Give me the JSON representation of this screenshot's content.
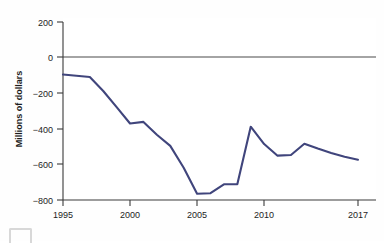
{
  "chart_data": {
    "type": "line",
    "title": "",
    "subtitle": "",
    "xlabel": "",
    "ylabel": "Millions of dollars",
    "xlim": [
      1995,
      2017.5
    ],
    "ylim": [
      -800,
      200
    ],
    "grid": false,
    "legend_position": "none",
    "y_ticks": [
      200,
      0,
      -200,
      -400,
      -600,
      -800
    ],
    "y_tick_labels": [
      "200",
      "0",
      "−200",
      "−400",
      "−600",
      "−800"
    ],
    "x_ticks": [
      1995,
      2000,
      2005,
      2010,
      2017
    ],
    "x_tick_labels": [
      "1995",
      "2000",
      "2005",
      "2010",
      "2017"
    ],
    "zero_reference_line": 0,
    "series": [
      {
        "name": "Net balance",
        "color": "#40457c",
        "x": [
          1995,
          1996,
          1997,
          1998,
          1999,
          2000,
          2001,
          2002,
          2003,
          2004,
          2005,
          2006,
          2007,
          2008,
          2009,
          2010,
          2011,
          2012,
          2013,
          2014,
          2015,
          2016,
          2017
        ],
        "values": [
          -98,
          -105,
          -112,
          -190,
          -280,
          -372,
          -363,
          -435,
          -497,
          -620,
          -765,
          -762,
          -712,
          -712,
          -390,
          -487,
          -552,
          -548,
          -485,
          -512,
          -537,
          -558,
          -575
        ]
      }
    ]
  },
  "axis": {
    "y_title": "Millions of dollars"
  },
  "artifacts": {
    "corner_marker": "page-scan-marker"
  }
}
